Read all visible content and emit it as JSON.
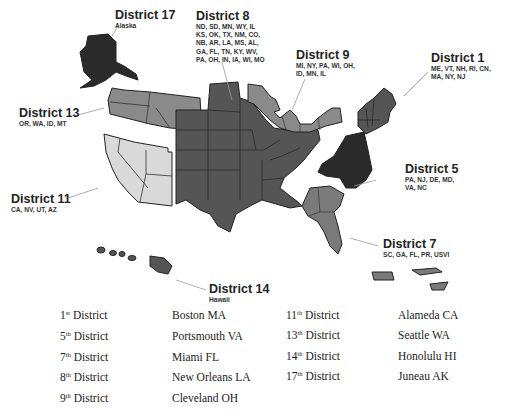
{
  "colors": {
    "darkest": "#2a2a2a",
    "dark": "#555555",
    "medium": "#7a7a7a",
    "light_medium": "#9a9a9a",
    "light": "#d9d9d9",
    "leader_line": "#999999",
    "outline": "#222222"
  },
  "districts": [
    {
      "id": "d17",
      "title": "District 17",
      "states": "Alaska"
    },
    {
      "id": "d8",
      "title": "District 8",
      "states": "ND, SD, MN, WY, IL\nKS, OK, TX, NM, CO,\nNB, AR, LA, MS, AL,\nGA, FL, TN, KY, WV,\nPA, OH, IN, IA, WI, MO"
    },
    {
      "id": "d9",
      "title": "District 9",
      "states": "MI, NY, PA, WI, OH,\nID, MN, IL"
    },
    {
      "id": "d1",
      "title": "District 1",
      "states": "ME, VT, NH, RI, CN,\nMA, NY, NJ"
    },
    {
      "id": "d13",
      "title": "District 13",
      "states": "OR, WA, ID, MT"
    },
    {
      "id": "d5",
      "title": "District 5",
      "states": "PA, NJ, DE, MD,\nVA, NC"
    },
    {
      "id": "d11",
      "title": "District 11",
      "states": "CA, NV, UT, AZ"
    },
    {
      "id": "d7",
      "title": "District 7",
      "states": "SC, GA, FL, PR, USVI"
    },
    {
      "id": "d14",
      "title": "District 14",
      "states": "Hawaii"
    }
  ],
  "legend": {
    "left": [
      {
        "num": "1",
        "suffix": "st",
        "label": "District",
        "city": "Boston MA"
      },
      {
        "num": "5",
        "suffix": "th",
        "label": "District",
        "city": "Portsmouth VA"
      },
      {
        "num": "7",
        "suffix": "th",
        "label": "District",
        "city": "Miami FL"
      },
      {
        "num": "8",
        "suffix": "th",
        "label": "District",
        "city": "New Orleans LA"
      },
      {
        "num": "9",
        "suffix": "th",
        "label": "District",
        "city": "Cleveland OH"
      }
    ],
    "right": [
      {
        "num": "11",
        "suffix": "th",
        "label": "District",
        "city": "Alameda CA"
      },
      {
        "num": "13",
        "suffix": "th",
        "label": "District",
        "city": "Seattle WA"
      },
      {
        "num": "14",
        "suffix": "th",
        "label": "District",
        "city": "Honolulu HI"
      },
      {
        "num": "17",
        "suffix": "th",
        "label": "District",
        "city": "Juneau AK"
      }
    ]
  }
}
